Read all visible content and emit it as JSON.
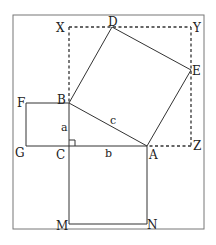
{
  "diagram": {
    "colors": {
      "line": "#333333",
      "frame": "#777777",
      "text": "#222222",
      "background": "#ffffff"
    },
    "frame": {
      "x": 13,
      "y": 15,
      "width": 191,
      "height": 214
    },
    "points": {
      "X": {
        "label": "X",
        "x": 69,
        "y": 27
      },
      "D": {
        "label": "D",
        "x": 112,
        "y": 27
      },
      "Y": {
        "label": "Y",
        "x": 191,
        "y": 27
      },
      "E": {
        "label": "E",
        "x": 191,
        "y": 70
      },
      "Z": {
        "label": "Z",
        "x": 191,
        "y": 146
      },
      "F": {
        "label": "F",
        "x": 26,
        "y": 103
      },
      "B": {
        "label": "B",
        "x": 69,
        "y": 103
      },
      "G": {
        "label": "G",
        "x": 26,
        "y": 146
      },
      "C": {
        "label": "C",
        "x": 69,
        "y": 146
      },
      "A": {
        "label": "A",
        "x": 147,
        "y": 146
      },
      "M": {
        "label": "M",
        "x": 69,
        "y": 224
      },
      "N": {
        "label": "N",
        "x": 147,
        "y": 224
      }
    },
    "side_labels": {
      "a": "a",
      "b": "b",
      "c": "c"
    },
    "shapes": [
      {
        "name": "square-on-a",
        "vertices": [
          "F",
          "B",
          "C",
          "G"
        ],
        "style": "solid"
      },
      {
        "name": "square-on-b",
        "vertices": [
          "C",
          "A",
          "N",
          "M"
        ],
        "style": "solid"
      },
      {
        "name": "square-on-c",
        "vertices": [
          "B",
          "A",
          "E",
          "D"
        ],
        "style": "solid"
      },
      {
        "name": "dashed-bounding-square",
        "vertices": [
          "X",
          "Y",
          "Z",
          "C"
        ],
        "style": "dashed"
      },
      {
        "name": "right-triangle",
        "vertices": [
          "A",
          "B",
          "C"
        ],
        "style": "solid",
        "right_angle_at": "C"
      }
    ]
  }
}
